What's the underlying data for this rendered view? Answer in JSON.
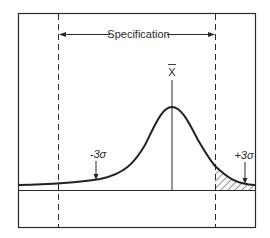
{
  "diagram": {
    "type": "normal-distribution-spec-limits",
    "labels": {
      "specification": "Specification",
      "mean": "X",
      "minus_three_sigma": "-3σ",
      "plus_three_sigma": "+3σ"
    },
    "colors": {
      "stroke": "#2a2a2a",
      "background": "#ffffff"
    },
    "notes": {
      "shaded_region": "Hatched tail beyond upper specification limit",
      "spec_limits": "Dashed vertical lines mark lower and upper specification limits"
    }
  }
}
